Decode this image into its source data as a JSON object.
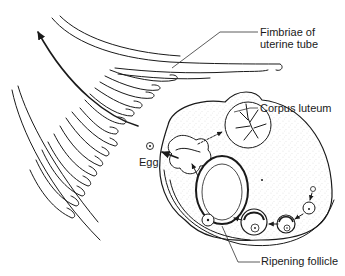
{
  "diagram": {
    "type": "anatomical line drawing",
    "labels": {
      "fimbriae_line1": "Fimbriae of",
      "fimbriae_line2": "uterine tube",
      "corpus_luteum": "Corpus luteum",
      "egg": "Egg",
      "ripening_follicle": "Ripening follicle"
    },
    "colors": {
      "ink": "#1a1a1a",
      "background": "#ffffff",
      "stipple": "#8a8a8a"
    }
  }
}
